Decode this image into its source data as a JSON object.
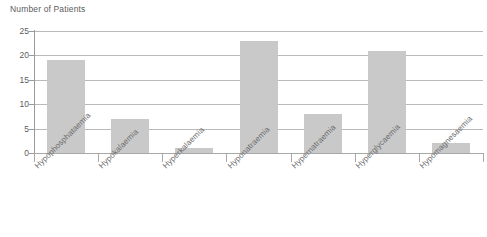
{
  "chart_data": {
    "type": "bar",
    "title": "Number of Patients",
    "xlabel": "",
    "ylabel": "",
    "ylim": [
      0,
      25
    ],
    "yticks": [
      0,
      5,
      10,
      15,
      20,
      25
    ],
    "grid": true,
    "legend": false,
    "bar_color": "#c9c9c9",
    "categories": [
      "Hypophosphataemia",
      "Hypokalaemia",
      "Hyperkalaemia",
      "Hyponatraemia",
      "Hypernatraemia",
      "Hyperglycaemia",
      "Hypomagnesaemia"
    ],
    "values": [
      19,
      7,
      1,
      23,
      8,
      21,
      2
    ]
  }
}
